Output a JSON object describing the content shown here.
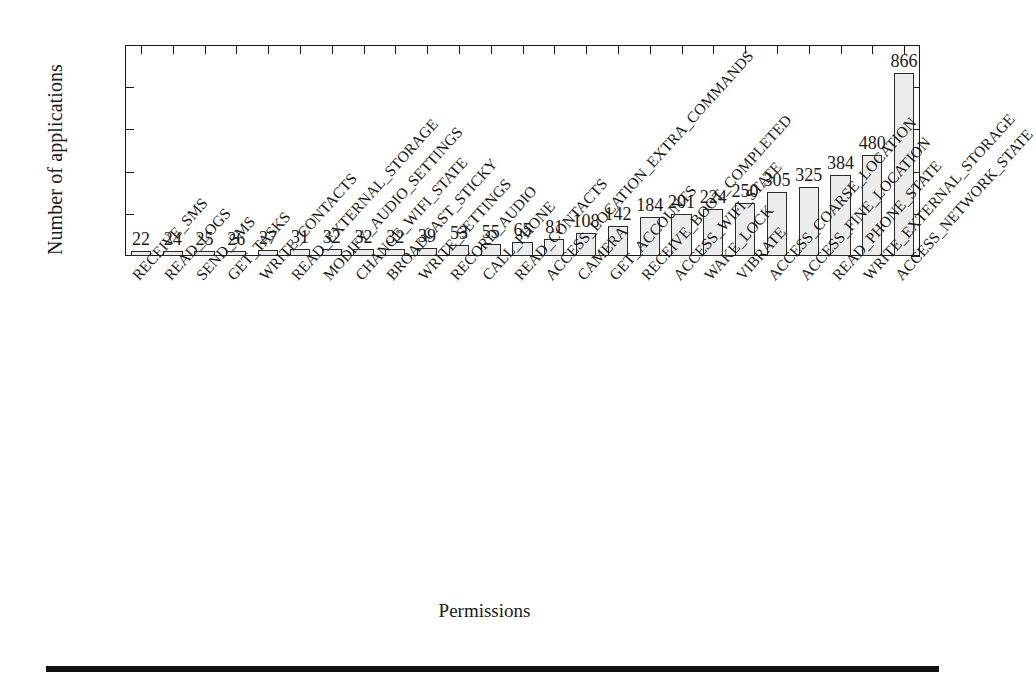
{
  "chart_data": {
    "type": "bar",
    "title": "",
    "xlabel": "Permissions",
    "ylabel": "Number of applications",
    "ylim": [
      0,
      1000
    ],
    "yticks": [
      0,
      200,
      400,
      600,
      800,
      1000
    ],
    "grid": false,
    "legend": null,
    "bar_value_labels": true,
    "categories": [
      "RECEIVE_SMS",
      "READ_LOGS",
      "SEND_SMS",
      "GET_TASKS",
      "WRITE_CONTACTS",
      "READ_EXTERNAL_STORAGE",
      "MODIFY_AUDIO_SETTINGS",
      "CHANGE_WIFI_STATE",
      "BROADCAST_STICKY",
      "WRITE_SETTINGS",
      "RECORD_AUDIO",
      "CALL_PHONE",
      "READ_CONTACTS",
      "ACCESS_LOCATION_EXTRA_COMMANDS",
      "CAMERA",
      "GET_ACCOUNTS",
      "RECEIVE_BOOT_COMPLETED",
      "ACCESS_WIFI_STATE",
      "WAKE_LOCK",
      "VIBRATE",
      "ACCESS_COARSE_LOCATION",
      "ACCESS_FINE_LOCATION",
      "READ_PHONE_STATE",
      "WRITE_EXTERNAL_STORAGE",
      "ACCESS_NETWORK_STATE"
    ],
    "values": [
      22,
      24,
      25,
      26,
      27,
      31,
      32,
      32,
      32,
      39,
      53,
      55,
      65,
      81,
      108,
      142,
      184,
      201,
      224,
      250,
      305,
      325,
      384,
      480,
      866
    ],
    "colors": {
      "bar_fill": "#ececec",
      "bar_stroke": "#2a2a2a",
      "axis": "#1a1a1a",
      "text": "#1a1a1a",
      "background": "#ffffff"
    }
  }
}
